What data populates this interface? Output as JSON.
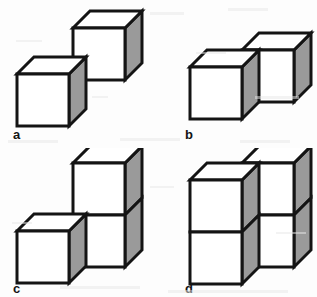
{
  "figure": {
    "width": 317,
    "height": 297,
    "background_color": "#fdfdfd",
    "style": {
      "edge_color": "#141414",
      "face_front_color": "#ffffff",
      "face_top_color": "#ffffff",
      "face_side_color": "#9a9a9a",
      "edge_width_px": 3,
      "cube_size_px": 52,
      "depth_offset_px": 17
    }
  },
  "panels": [
    {
      "id": "a",
      "label": "a",
      "cube_count": 2,
      "arrangement": "two cubes meeting corner-to-corner on a diagonal",
      "cubes": [
        {
          "col": 0,
          "row": 0,
          "depth": 0
        },
        {
          "col": 1,
          "row": 1,
          "depth": 1
        }
      ]
    },
    {
      "id": "b",
      "label": "b",
      "cube_count": 2,
      "arrangement": "two cubes side by side, right cube stepped back and up",
      "cubes": [
        {
          "col": 0,
          "row": 0,
          "depth": 0
        },
        {
          "col": 1,
          "row": 0,
          "depth": 1
        }
      ]
    },
    {
      "id": "c",
      "label": "c",
      "cube_count": 3,
      "arrangement": "one front cube plus a stack of two cubes behind and to the right",
      "cubes": [
        {
          "col": 0,
          "row": 0,
          "depth": 0
        },
        {
          "col": 1,
          "row": 0,
          "depth": 1
        },
        {
          "col": 1,
          "row": 1,
          "depth": 1
        }
      ]
    },
    {
      "id": "d",
      "label": "d",
      "cube_count": 4,
      "arrangement": "two stacks of two cubes, right stack stepped back and up",
      "cubes": [
        {
          "col": 0,
          "row": 0,
          "depth": 0
        },
        {
          "col": 0,
          "row": 1,
          "depth": 0
        },
        {
          "col": 1,
          "row": 0,
          "depth": 1
        },
        {
          "col": 1,
          "row": 1,
          "depth": 1
        }
      ]
    }
  ]
}
